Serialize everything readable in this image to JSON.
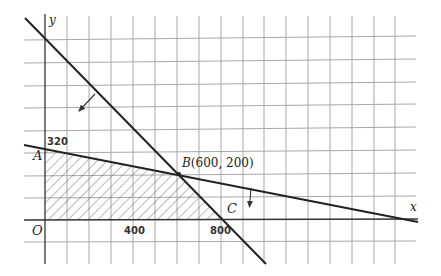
{
  "diagram": {
    "type": "linear-programming-feasible-region",
    "axes": {
      "x_label": "x",
      "y_label": "y",
      "origin_label": "O"
    },
    "ticks": {
      "y_320": "320",
      "x_400": "400",
      "x_800": "800"
    },
    "points": {
      "A": {
        "label": "A",
        "x": 0,
        "y": 320
      },
      "B": {
        "label": "B(600, 200)",
        "x": 600,
        "y": 200
      },
      "C": {
        "label": "C",
        "x": 800,
        "y": 0
      },
      "O": {
        "label": "O",
        "x": 0,
        "y": 0
      }
    },
    "lines": [
      {
        "name": "line-AB",
        "through": [
          [
            0,
            320
          ],
          [
            1600,
            0
          ]
        ],
        "arrow": "down"
      },
      {
        "name": "line-BC",
        "through": [
          [
            0,
            800
          ],
          [
            800,
            0
          ]
        ],
        "arrow": "down-left"
      }
    ],
    "feasible_region": {
      "vertices": [
        [
          0,
          0
        ],
        [
          0,
          320
        ],
        [
          600,
          200
        ],
        [
          800,
          0
        ]
      ],
      "fill": "hatched"
    },
    "grid": {
      "unit": 100,
      "color": "#a8a8a8"
    },
    "colors": {
      "line": "#222222",
      "grid": "#a8a8a8",
      "hatch": "#555555"
    }
  }
}
